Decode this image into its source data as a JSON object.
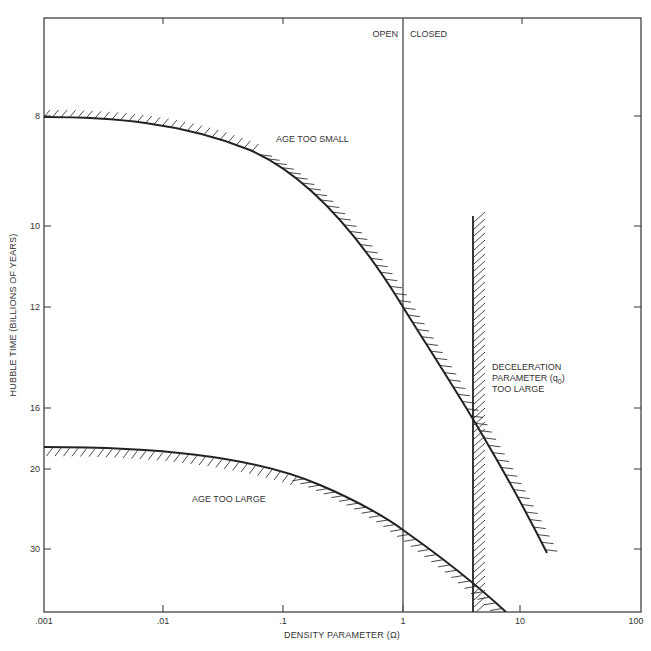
{
  "chart_data": {
    "type": "line",
    "title": "",
    "xlabel": "DENSITY PARAMETER (Ω)",
    "ylabel": "HUBBLE TIME (BILLIONS OF YEARS)",
    "xscale": "log",
    "xlim": [
      0.001,
      100
    ],
    "x_ticks": [
      ".001",
      ".01",
      ".1",
      "1",
      "10",
      "100"
    ],
    "y_ticks": [
      "8",
      "10",
      "12",
      "16",
      "20",
      "30"
    ],
    "y_axis_note": "nonlinear (reciprocal-like) scale, increasing downward",
    "grid": false,
    "legend": null,
    "series": [
      {
        "name": "Age too small boundary",
        "hatch_side": "upper-right",
        "points": [
          [
            0.001,
            8.0
          ],
          [
            0.0077,
            8.1
          ],
          [
            0.021,
            8.35
          ],
          [
            0.055,
            8.8
          ],
          [
            0.1,
            9.2
          ],
          [
            0.2,
            10.0
          ],
          [
            0.43,
            10.9
          ],
          [
            1.0,
            12.0
          ],
          [
            2.0,
            13.6
          ],
          [
            4.0,
            16.0
          ],
          [
            6.5,
            18.5
          ],
          [
            18,
            30
          ]
        ]
      },
      {
        "name": "Age too large boundary",
        "hatch_side": "lower-left",
        "points": [
          [
            0.001,
            19.0
          ],
          [
            0.0077,
            19.2
          ],
          [
            0.05,
            20.0
          ],
          [
            0.12,
            21.5
          ],
          [
            0.31,
            24.0
          ],
          [
            1.0,
            27.5
          ],
          [
            2.0,
            30.5
          ],
          [
            4.0,
            34.5
          ],
          [
            7.0,
            38
          ]
        ]
      },
      {
        "name": "Deceleration parameter limit",
        "hatch_side": "right",
        "points": [
          [
            4.0,
            9.8
          ],
          [
            4.0,
            38
          ]
        ]
      }
    ],
    "reference_lines": [
      {
        "x": 1,
        "label_left": "OPEN",
        "label_right": "CLOSED"
      }
    ],
    "annotations": [
      {
        "text": "AGE TOO SMALL"
      },
      {
        "text": "AGE TOO LARGE"
      },
      {
        "text_lines": [
          "DECELERATION",
          "PARAMETER (q",
          ")",
          "TOO LARGE"
        ],
        "subscript": "0"
      }
    ]
  },
  "labels": {
    "open": "OPEN",
    "closed": "CLOSED",
    "age_too_small": "AGE TOO SMALL",
    "age_too_large": "AGE TOO LARGE",
    "decel_line1": "DECELERATION",
    "decel_line2": "PARAMETER (q",
    "decel_sub": "0",
    "decel_close": ")",
    "decel_line3": "TOO LARGE",
    "xlabel": "DENSITY PARAMETER (Ω)",
    "ylabel": "HUBBLE TIME (BILLIONS OF YEARS)",
    "xticks": [
      ".001",
      ".01",
      ".1",
      "1",
      "10",
      "100"
    ],
    "yticks": [
      "8",
      "10",
      "12",
      "16",
      "20",
      "30"
    ]
  },
  "colors": {
    "ink": "#222222",
    "text": "#333333",
    "background": "#ffffff"
  }
}
